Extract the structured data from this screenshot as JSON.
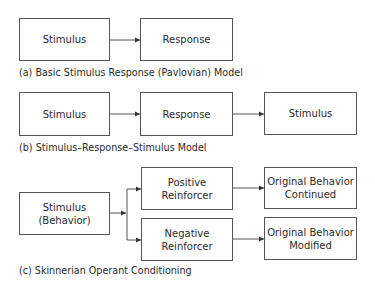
{
  "diagram": {
    "panel_a": {
      "caption": "(a) Basic Stimulus Response (Pavlovian) Model",
      "nodes": [
        {
          "id": "a-stimulus",
          "label": "Stimulus"
        },
        {
          "id": "a-response",
          "label": "Response"
        }
      ],
      "edges": [
        {
          "from": "a-stimulus",
          "to": "a-response"
        }
      ]
    },
    "panel_b": {
      "caption": "(b) Stimulus–Response–Stimulus Model",
      "nodes": [
        {
          "id": "b-stimulus-1",
          "label": "Stimulus"
        },
        {
          "id": "b-response",
          "label": "Response"
        },
        {
          "id": "b-stimulus-2",
          "label": "Stimulus"
        }
      ],
      "edges": [
        {
          "from": "b-stimulus-1",
          "to": "b-response"
        },
        {
          "from": "b-response",
          "to": "b-stimulus-2"
        }
      ]
    },
    "panel_c": {
      "caption": "(c) Skinnerian Operant Conditioning",
      "nodes": [
        {
          "id": "c-stimulus",
          "label": "Stimulus\n(Behavior)"
        },
        {
          "id": "c-positive",
          "label": "Positive\nReinforcer"
        },
        {
          "id": "c-negative",
          "label": "Negative\nReinforcer"
        },
        {
          "id": "c-continued",
          "label": "Original Behavior\nContinued"
        },
        {
          "id": "c-modified",
          "label": "Original Behavior\nModified"
        }
      ],
      "edges": [
        {
          "from": "c-stimulus",
          "to": "c-positive"
        },
        {
          "from": "c-stimulus",
          "to": "c-negative"
        },
        {
          "from": "c-positive",
          "to": "c-continued"
        },
        {
          "from": "c-negative",
          "to": "c-modified"
        }
      ]
    }
  },
  "colors": {
    "stroke": "#555555",
    "text": "#2a2a2a",
    "background": "#ffffff"
  }
}
